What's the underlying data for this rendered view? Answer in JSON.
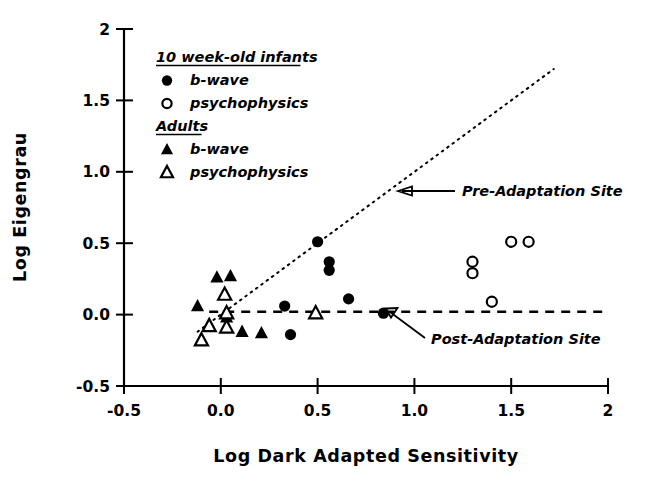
{
  "chart_data": {
    "type": "scatter",
    "title": "",
    "xlabel": "Log Dark Adapted Sensitivity",
    "ylabel": "Log Eigengrau",
    "xlim": [
      -0.5,
      2.0
    ],
    "ylim": [
      -0.5,
      2.0
    ],
    "xticks": [
      "-0.5",
      "0.0",
      "0.5",
      "1.0",
      "1.5",
      "2"
    ],
    "xtick_values": [
      -0.5,
      0.0,
      0.5,
      1.0,
      1.5,
      2.0
    ],
    "yticks": [
      "-0.5",
      "0.0",
      "0.5",
      "1.0",
      "1.5",
      "2"
    ],
    "ytick_values": [
      -0.5,
      0.0,
      0.5,
      1.0,
      1.5,
      2.0
    ],
    "grid": false,
    "legend_position": "upper-left-inside",
    "series": [
      {
        "name": "b-wave",
        "group": "10 week-old infants",
        "marker": "filled-circle",
        "points": [
          {
            "x": 0.33,
            "y": 0.06
          },
          {
            "x": 0.36,
            "y": -0.14
          },
          {
            "x": 0.5,
            "y": 0.51
          },
          {
            "x": 0.56,
            "y": 0.37
          },
          {
            "x": 0.56,
            "y": 0.31
          },
          {
            "x": 0.66,
            "y": 0.11
          },
          {
            "x": 0.84,
            "y": 0.01
          }
        ]
      },
      {
        "name": "psychophysics",
        "group": "10 week-old infants",
        "marker": "open-circle",
        "points": [
          {
            "x": 1.3,
            "y": 0.37
          },
          {
            "x": 1.3,
            "y": 0.29
          },
          {
            "x": 1.4,
            "y": 0.09
          },
          {
            "x": 1.5,
            "y": 0.51
          },
          {
            "x": 1.59,
            "y": 0.51
          }
        ]
      },
      {
        "name": "b-wave",
        "group": "Adults",
        "marker": "filled-triangle",
        "points": [
          {
            "x": -0.12,
            "y": 0.06
          },
          {
            "x": -0.02,
            "y": 0.26
          },
          {
            "x": 0.05,
            "y": 0.27
          },
          {
            "x": 0.03,
            "y": -0.02
          },
          {
            "x": 0.11,
            "y": -0.12
          },
          {
            "x": 0.21,
            "y": -0.13
          }
        ]
      },
      {
        "name": "psychophysics",
        "group": "Adults",
        "marker": "open-triangle",
        "points": [
          {
            "x": 0.02,
            "y": 0.14
          },
          {
            "x": 0.03,
            "y": 0.01
          },
          {
            "x": -0.06,
            "y": -0.08
          },
          {
            "x": 0.03,
            "y": -0.09
          },
          {
            "x": -0.1,
            "y": -0.18
          },
          {
            "x": 0.49,
            "y": 0.01
          }
        ]
      }
    ],
    "reference_lines": [
      {
        "name": "pre-adaptation-site",
        "style": "dotted",
        "description": "unity slope line",
        "from": {
          "x": -0.12,
          "y": -0.12
        },
        "to": {
          "x": 1.72,
          "y": 1.72
        }
      },
      {
        "name": "post-adaptation-site",
        "style": "dashed",
        "description": "horizontal line at y = 0.02",
        "from": {
          "x": -0.06,
          "y": 0.02
        },
        "to": {
          "x": 2.0,
          "y": 0.02
        }
      }
    ],
    "annotations": [
      {
        "label": "Pre-Adaptation Site",
        "points_to": {
          "x": 0.95,
          "y": 0.95
        }
      },
      {
        "label": "Post-Adaptation Site",
        "points_to": {
          "x": 0.84,
          "y": 0.02
        }
      }
    ]
  },
  "legend": {
    "groups": [
      {
        "heading": "10 week-old infants",
        "items": [
          {
            "label": "b-wave",
            "marker": "filled-circle"
          },
          {
            "label": "psychophysics",
            "marker": "open-circle"
          }
        ]
      },
      {
        "heading": "Adults",
        "items": [
          {
            "label": "b-wave",
            "marker": "filled-triangle"
          },
          {
            "label": "psychophysics",
            "marker": "open-triangle"
          }
        ]
      }
    ]
  },
  "colors": {
    "ink": "#000000",
    "background": "#ffffff"
  }
}
